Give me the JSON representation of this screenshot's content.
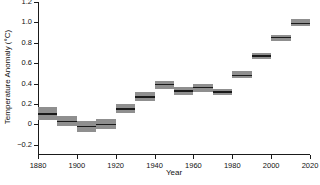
{
  "chart_data": {
    "type": "bar",
    "title": "",
    "xlabel": "Year",
    "ylabel": "Temperature Anomaly (°C)",
    "xlim": [
      1880,
      2020
    ],
    "ylim": [
      -0.3,
      1.2
    ],
    "xticks": [
      1880,
      1900,
      1920,
      1940,
      1960,
      1980,
      2000,
      2020
    ],
    "xtick_labels": [
      "1880",
      "1900",
      "1920",
      "1940",
      "1960",
      "1980",
      "2000",
      "2020"
    ],
    "yticks": [
      -0.2,
      0,
      0.2,
      0.4,
      0.6,
      0.8,
      1.0,
      1.2
    ],
    "ytick_labels": [
      "−0.2",
      "0",
      "0.2",
      "0.4",
      "0.6",
      "0.8",
      "1.0",
      "1.2"
    ],
    "grid": false,
    "legend": null,
    "bar_color": "#8f8f8f",
    "center_line_color": "#1a1a1a",
    "axis_color": "#1a1a1a",
    "categories": [
      "1880s",
      "1890s",
      "1900s",
      "1910s",
      "1920s",
      "1930s",
      "1940s",
      "1950s",
      "1960s",
      "1970s",
      "1980s",
      "1990s",
      "2000s",
      "2010s"
    ],
    "x_start": [
      1880,
      1890,
      1900,
      1910,
      1920,
      1930,
      1940,
      1950,
      1960,
      1970,
      1980,
      1990,
      2000,
      2010
    ],
    "x_end": [
      1890,
      1900,
      1910,
      1920,
      1930,
      1940,
      1950,
      1960,
      1970,
      1980,
      1990,
      2000,
      2010,
      2020
    ],
    "values": [
      0.1,
      0.03,
      -0.02,
      0.0,
      0.15,
      0.27,
      0.39,
      0.33,
      0.36,
      0.32,
      0.48,
      0.67,
      0.85,
      0.99
    ],
    "upper": [
      0.17,
      0.08,
      0.03,
      0.05,
      0.2,
      0.32,
      0.43,
      0.37,
      0.4,
      0.35,
      0.52,
      0.7,
      0.88,
      1.03
    ],
    "lower": [
      0.04,
      -0.02,
      -0.07,
      -0.05,
      0.11,
      0.23,
      0.35,
      0.29,
      0.32,
      0.29,
      0.45,
      0.64,
      0.82,
      0.96
    ]
  }
}
